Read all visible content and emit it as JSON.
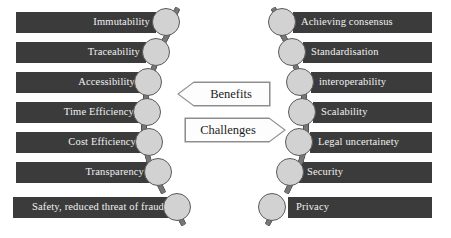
{
  "figure": {
    "type": "chain-diagram",
    "background_color": "#ffffff",
    "bar_color": "#3b3b3b",
    "bar_text_color": "#f2f2f2",
    "node_fill_color": "#d2d2d2",
    "node_stroke_color": "#5a5a5a",
    "arrow_fill_color": "#fdfdfd",
    "arrow_stroke_color": "#8c8c8c",
    "arrow_text_color": "#1c1c1c"
  },
  "left_column": {
    "name": "benefits-chain",
    "items": [
      {
        "label": "Immutability"
      },
      {
        "label": "Traceability"
      },
      {
        "label": "Accessibility"
      },
      {
        "label": "Time Efficiency"
      },
      {
        "label": "Cost Efficiency"
      },
      {
        "label": "Transparency"
      },
      {
        "label": "Safety, reduced threat of fraud"
      }
    ]
  },
  "right_column": {
    "name": "challenges-chain",
    "items": [
      {
        "label": "Achieving consensus"
      },
      {
        "label": "Standardisation"
      },
      {
        "label": "interoperability"
      },
      {
        "label": "Scalability"
      },
      {
        "label": "Legal uncertainety"
      },
      {
        "label": "Security"
      },
      {
        "label": "Privacy"
      }
    ]
  },
  "center": {
    "benefits_label": "Benefits",
    "challenges_label": "Challenges"
  }
}
